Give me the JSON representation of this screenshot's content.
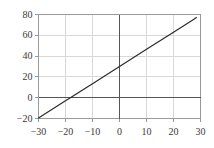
{
  "chart_data": {
    "type": "line",
    "title": "",
    "xlabel": "",
    "ylabel": "",
    "xlim": [
      -30,
      30
    ],
    "ylim": [
      -20,
      80
    ],
    "xticks": [
      -30,
      -20,
      -10,
      0,
      10,
      20,
      30
    ],
    "yticks": [
      -20,
      0,
      20,
      40,
      60,
      80
    ],
    "xtick_labels": [
      "−30",
      "−20",
      "−10",
      "0",
      "10",
      "20",
      "30"
    ],
    "ytick_labels": [
      "−20",
      "0",
      "20",
      "40",
      "60",
      "80"
    ],
    "grid": true,
    "legend": null,
    "series": [
      {
        "name": "line",
        "equation": "y = 1.65x + 30",
        "slope": 1.65,
        "intercept": 30,
        "x_intercept": -18.2,
        "color": "#2b2b2b",
        "points": [
          {
            "x": -30,
            "y": -19.5
          },
          {
            "x": -20,
            "y": -3
          },
          {
            "x": -18.2,
            "y": 0
          },
          {
            "x": -10,
            "y": 13.5
          },
          {
            "x": 0,
            "y": 30
          },
          {
            "x": 10,
            "y": 46.5
          },
          {
            "x": 20,
            "y": 63
          },
          {
            "x": 27,
            "y": 74.5
          },
          {
            "x": 28.5,
            "y": 77
          }
        ]
      }
    ],
    "axis_lines": {
      "x_zero": 0,
      "y_zero": 0
    },
    "colors": {
      "line": "#2b2b2b",
      "grid": "#d8d8d8",
      "frame": "#9a9a9a",
      "zero_axis": "#555555",
      "tick_text": "#3a3a3a"
    }
  }
}
